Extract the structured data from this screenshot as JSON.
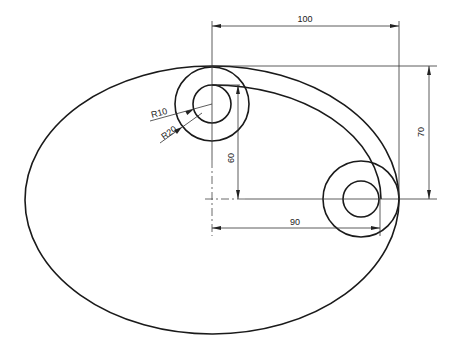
{
  "drawing": {
    "type": "engineering-drawing",
    "colors": {
      "line": "#1a1a1a",
      "background": "#ffffff"
    },
    "dimensions": {
      "overall_width": "100",
      "height_right": "70",
      "inner_height": "60",
      "center_distance": "90",
      "radius_inner": "R10",
      "radius_outer": "R20"
    }
  }
}
